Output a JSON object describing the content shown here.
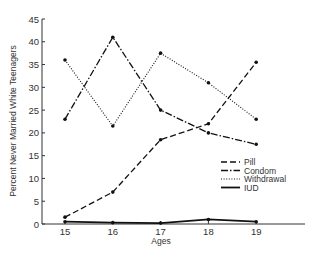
{
  "chart_data": {
    "type": "line",
    "title": "",
    "xlabel": "Ages",
    "ylabel": "Percent Never Married White Teenagers",
    "x": [
      15,
      16,
      17,
      18,
      19
    ],
    "x_tick_labels": [
      "15",
      "16",
      "17",
      "18",
      "19"
    ],
    "y_ticks": [
      0,
      5,
      10,
      15,
      20,
      25,
      30,
      35,
      40,
      45
    ],
    "ylim": [
      0,
      45
    ],
    "grid": false,
    "legend_position": "lower right inside",
    "series": [
      {
        "name": "Pill",
        "style": "dashed",
        "values": [
          1.5,
          7,
          18.5,
          22,
          35.5
        ]
      },
      {
        "name": "Condom",
        "style": "dash-dot",
        "values": [
          23,
          41,
          25,
          20,
          17.5
        ]
      },
      {
        "name": "Withdrawal",
        "style": "dotted",
        "values": [
          36,
          21.5,
          37.5,
          31,
          23
        ]
      },
      {
        "name": "IUD",
        "style": "solid",
        "values": [
          0.5,
          0.3,
          0.2,
          1,
          0.5
        ]
      }
    ]
  },
  "legend": {
    "items": [
      "Pill",
      "Condom",
      "Withdrawal",
      "IUD"
    ]
  },
  "colors": {
    "line": "#111111",
    "text": "#333333"
  }
}
